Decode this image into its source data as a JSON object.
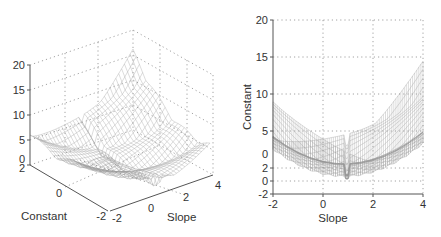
{
  "chart_data": [
    {
      "type": "surface3d",
      "title": "",
      "xlabel": "Slope",
      "ylabel": "Constant",
      "zlabel": "",
      "x_ticks": [
        "-2",
        "0",
        "2",
        "4"
      ],
      "y_ticks": [
        "-2",
        "0",
        "2"
      ],
      "z_ticks": [
        "0",
        "5",
        "10",
        "15",
        "20"
      ],
      "xlim": [
        -2,
        4
      ],
      "ylim": [
        -2,
        2
      ],
      "zlim": [
        0,
        20
      ],
      "grid": true,
      "style": "wireframe mesh, gray",
      "description": "Bowl-shaped error surface with minimum near slope≈0.5–1, constant≈0; ridges rise toward slope=4 reaching ~20 at the back corner."
    },
    {
      "type": "surface3d-side-view",
      "title": "",
      "xlabel": "Slope",
      "ylabel": "Constant",
      "x_ticks": [
        "-2",
        "0",
        "2",
        "4"
      ],
      "y_ticks": [
        "-2",
        "0",
        "2",
        "0",
        "5",
        "10",
        "15",
        "20"
      ],
      "xlim": [
        -2,
        4
      ],
      "ylim": [
        -2,
        20
      ],
      "grid": true,
      "style": "wireframe mesh, gray",
      "description": "Same surface viewed from the side: values ~5 at slope=-2, dropping to minimum ~0.5 near slope 0.5–1 (with a sharp notch at slope≈1), rising to ~16 at slope=4."
    }
  ],
  "left": {
    "z_ticks": [
      "20",
      "15",
      "10",
      "5",
      "0"
    ],
    "y_ticks": [
      "2",
      "0",
      "-2"
    ],
    "x_ticks": [
      "-2",
      "0",
      "2",
      "4"
    ],
    "xlabel": "Slope",
    "ylabel": "Constant"
  },
  "right": {
    "y_ticks": [
      "20",
      "15",
      "10",
      "5",
      "0",
      "2",
      "0",
      "-2"
    ],
    "x_ticks": [
      "-2",
      "0",
      "2",
      "4"
    ],
    "xlabel": "Slope",
    "ylabel": "Constant"
  }
}
